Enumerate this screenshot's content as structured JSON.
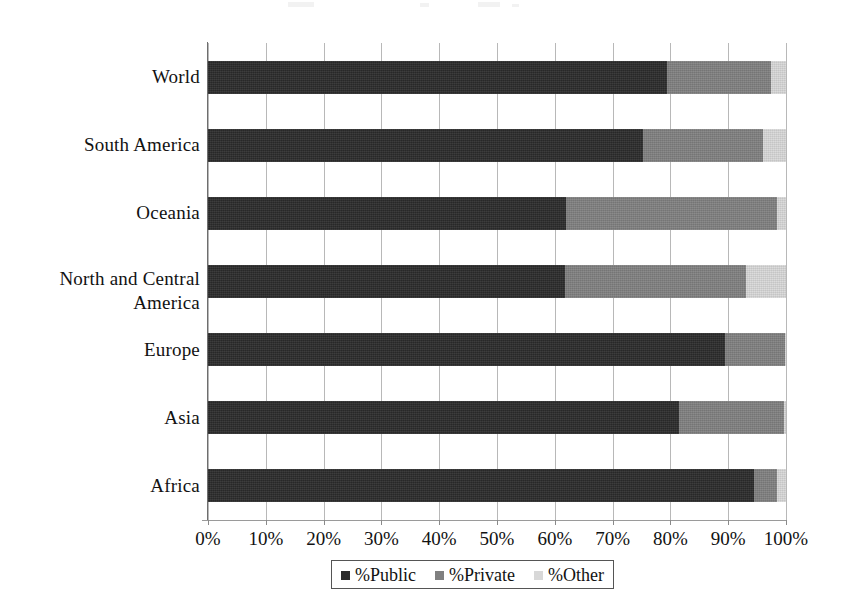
{
  "chart_data": {
    "type": "bar",
    "orientation": "horizontal",
    "stacked": true,
    "stacked_normalized": true,
    "title": "",
    "subtitle": "",
    "xlabel": "",
    "ylabel": "",
    "xlim": [
      0,
      100
    ],
    "xticks": [
      0,
      10,
      20,
      30,
      40,
      50,
      60,
      70,
      80,
      90,
      100
    ],
    "xticklabels": [
      "0%",
      "10%",
      "20%",
      "30%",
      "40%",
      "50%",
      "60%",
      "70%",
      "80%",
      "90%",
      "100%"
    ],
    "grid": "vertical",
    "legend_position": "bottom",
    "categories": [
      "World",
      "South America",
      "Oceania",
      "North and Central America",
      "Europe",
      "Asia",
      "Africa"
    ],
    "series": [
      {
        "name": "%Public",
        "color": "#2b2b2b",
        "values": [
          79.4,
          75.2,
          61.9,
          61.8,
          89.4,
          81.5,
          94.5
        ]
      },
      {
        "name": "%Private",
        "color": "#808080",
        "values": [
          18.0,
          20.8,
          36.6,
          31.2,
          10.4,
          18.2,
          3.9
        ]
      },
      {
        "name": "%Other",
        "color": "#d8d8d8",
        "values": [
          2.6,
          4.0,
          1.5,
          7.0,
          0.2,
          0.3,
          1.6
        ]
      }
    ]
  },
  "legend": {
    "items": [
      {
        "label": "%Public",
        "color": "#2b2b2b"
      },
      {
        "label": "%Private",
        "color": "#808080"
      },
      {
        "label": "%Other",
        "color": "#d8d8d8"
      }
    ]
  }
}
